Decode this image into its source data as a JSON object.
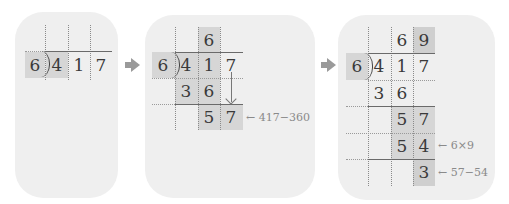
{
  "diagram": {
    "colors": {
      "panel_bg": "#efefef",
      "highlight": "#d6d6d6",
      "line": "#6a6a6a",
      "note": "#8a8a8a"
    },
    "steps": [
      {
        "divisor": "6",
        "dividend": [
          "4",
          "1",
          "7"
        ]
      },
      {
        "divisor": "6",
        "quotient": [
          "",
          "6",
          ""
        ],
        "dividend": [
          "4",
          "1",
          "7"
        ],
        "product": [
          "3",
          "6"
        ],
        "remainder": [
          "5",
          "7"
        ],
        "note": "← 417−360"
      },
      {
        "divisor": "6",
        "quotient": [
          "",
          "6",
          "9"
        ],
        "dividend": [
          "4",
          "1",
          "7"
        ],
        "product1": [
          "3",
          "6"
        ],
        "remainder1": [
          "5",
          "7"
        ],
        "product2": [
          "5",
          "4"
        ],
        "product2_note": "← 6×9",
        "remainder2": [
          "3"
        ],
        "remainder2_note": "← 57−54"
      }
    ]
  }
}
